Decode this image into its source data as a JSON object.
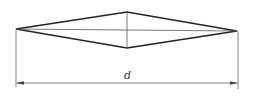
{
  "diagram": {
    "type": "rhombus-with-dimension",
    "dimension_label": "d",
    "stroke_color": "#222222",
    "thin_stroke_color": "#555555",
    "vertices": {
      "left": [
        16,
        29
      ],
      "top": [
        127,
        12
      ],
      "right": [
        237,
        31
      ],
      "bottom": [
        127,
        48
      ]
    },
    "dimension_line": {
      "y": 83,
      "x1": 16,
      "x2": 238
    }
  }
}
